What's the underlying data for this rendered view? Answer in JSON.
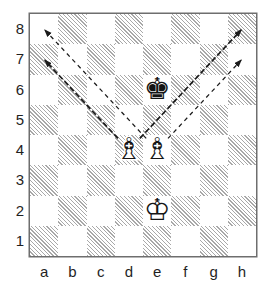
{
  "board": {
    "files": [
      "a",
      "b",
      "c",
      "d",
      "e",
      "f",
      "g",
      "h"
    ],
    "ranks_top_to_bottom": [
      "8",
      "7",
      "6",
      "5",
      "4",
      "3",
      "2",
      "1"
    ],
    "pieces": [
      {
        "square": "e6",
        "color": "black",
        "type": "king",
        "face_glyph": "♚",
        "halo_glyph": "♚"
      },
      {
        "square": "d4",
        "color": "white",
        "type": "bishop",
        "face_glyph": "♗",
        "halo_glyph": "♝"
      },
      {
        "square": "e4",
        "color": "white",
        "type": "bishop",
        "face_glyph": "♗",
        "halo_glyph": "♝"
      },
      {
        "square": "e2",
        "color": "white",
        "type": "king",
        "face_glyph": "♔",
        "halo_glyph": "♚"
      }
    ],
    "arrows": [
      {
        "from": "e4",
        "to": "a8",
        "style": "light"
      },
      {
        "from": "d4",
        "to": "a7",
        "style": "heavy"
      },
      {
        "from": "d4",
        "to": "h8",
        "style": "heavy"
      },
      {
        "from": "e4",
        "to": "h7",
        "style": "light"
      }
    ],
    "colors": {
      "background": "#ffffff",
      "light_square": "#ffffff",
      "dark_square_hatch": "#a8a8a8",
      "board_border": "#6e6e6e",
      "arrow": "#1b1b1b",
      "label_text": "#1f1f1f"
    }
  }
}
